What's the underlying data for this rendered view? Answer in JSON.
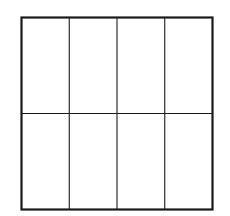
{
  "diagram": {
    "type": "grid",
    "rows": 2,
    "columns": 4,
    "colors": {
      "background": "#ffffff",
      "stroke": "#1a1a1a"
    },
    "outer_box": {
      "x": 21.5,
      "y": 17.5,
      "width": 191,
      "height": 192,
      "stroke_width": 2.2
    },
    "inner_line_width": 1.1
  }
}
